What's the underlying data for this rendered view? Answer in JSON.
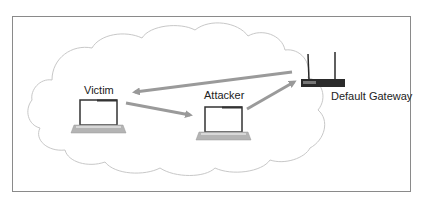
{
  "diagram": {
    "type": "network-mitm",
    "nodes": [
      {
        "id": "victim",
        "label": "Victim",
        "icon": "laptop-icon"
      },
      {
        "id": "attacker",
        "label": "Attacker",
        "icon": "laptop-icon"
      },
      {
        "id": "gateway",
        "label": "Default Gateway",
        "icon": "router-icon"
      }
    ],
    "edges": [
      {
        "from": "gateway",
        "to": "victim"
      },
      {
        "from": "victim",
        "to": "attacker"
      },
      {
        "from": "attacker",
        "to": "gateway"
      }
    ],
    "background": "cloud-icon",
    "colors": {
      "arrow": "#999999",
      "cloud_stroke": "#c8c8c8",
      "frame": "#8a8a8a",
      "laptop_frame": "#333333",
      "router": "#2a2a2a"
    }
  }
}
